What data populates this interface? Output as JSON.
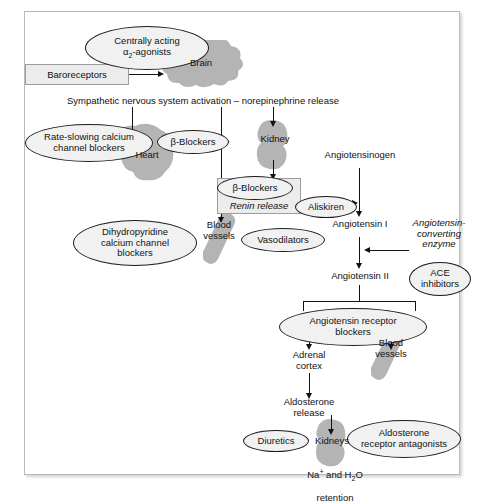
{
  "diagram": {
    "pathway_labels": {
      "sympathetic": "Sympathetic nervous system activation – norepinephrine release",
      "brain": "Brain",
      "heart": "Heart",
      "kidney": "Kidney",
      "blood_vessels_upper": "Blood\nvessels",
      "blood_vessels_lower": "Blood\nvessels",
      "angiotensinogen": "Angiotensinogen",
      "angiotensin_i": "Angiotensin I",
      "angiotensin_ii": "Angiotensin II",
      "ace_enzyme": "Angiotensin-\nconverting\nenzyme",
      "renin_release": "Renin release",
      "adrenal_cortex": "Adrenal\ncortex",
      "aldosterone_release": "Aldosterone\nrelease",
      "kidneys": "Kidneys",
      "retention": "retention"
    },
    "boxes": {
      "baroreceptors": "Baroreceptors"
    },
    "drug_ovals": {
      "central_agonists": "Centrally acting",
      "central_agonists_line2": "-agonists",
      "central_agonists_greek": "α",
      "central_agonists_sub": "2",
      "rate_slowing_ccb": "Rate-slowing calcium\nchannel blockers",
      "beta_blockers_heart": "-Blockers",
      "beta_blockers_renin": "-Blockers",
      "beta_symbol": "β",
      "dihydropyridine_ccb": "Dihydropyridine\ncalcium channel\nblockers",
      "vasodilators": "Vasodilators",
      "aliskiren": "Aliskiren",
      "ace_inhibitors": "ACE\ninhibitors",
      "arb": "Angiotensin receptor\nblockers",
      "diuretics": "Diuretics",
      "aldosterone_antagonists": "Aldosterone\nreceptor antagonists"
    },
    "chemistry": {
      "na_symbol": "Na",
      "na_charge": "+",
      "and_text": " and H",
      "h2o_sub": "2",
      "h2o_rest": "O"
    },
    "colors": {
      "organ_gray": "#b4b4b4",
      "oval_fill": "#f1f1f1",
      "box_fill": "#ececec",
      "line": "#111111",
      "frame_border": "#b9b9b9"
    }
  }
}
